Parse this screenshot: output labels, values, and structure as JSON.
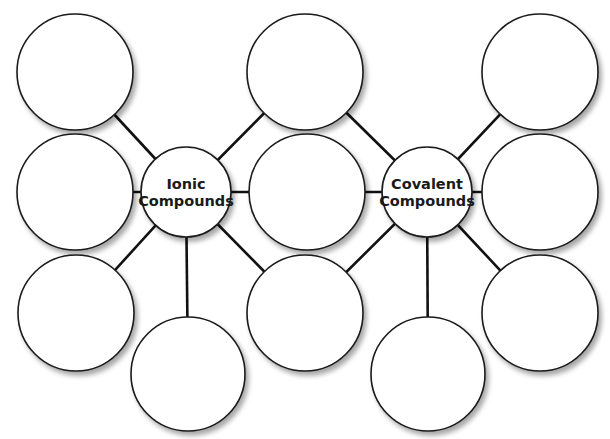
{
  "diagram": {
    "type": "double-bubble-map",
    "colors": {
      "stroke": "#1a1a1a",
      "fill": "#ffffff",
      "background": "#ffffff"
    },
    "hubs": [
      {
        "id": "ionic",
        "label_lines": [
          "Ionic",
          "Compounds"
        ]
      },
      {
        "id": "covalent",
        "label_lines": [
          "Covalent",
          "Compounds"
        ]
      }
    ],
    "bubbles": [
      {
        "id": "ionic-top-left",
        "text": "",
        "connects": [
          "ionic"
        ]
      },
      {
        "id": "ionic-mid-left",
        "text": "",
        "connects": [
          "ionic"
        ]
      },
      {
        "id": "ionic-bottom-left",
        "text": "",
        "connects": [
          "ionic"
        ]
      },
      {
        "id": "ionic-bottom",
        "text": "",
        "connects": [
          "ionic"
        ]
      },
      {
        "id": "shared-top",
        "text": "",
        "connects": [
          "ionic",
          "covalent"
        ]
      },
      {
        "id": "shared-mid",
        "text": "",
        "connects": [
          "ionic",
          "covalent"
        ]
      },
      {
        "id": "shared-bottom",
        "text": "",
        "connects": [
          "ionic",
          "covalent"
        ]
      },
      {
        "id": "covalent-top-right",
        "text": "",
        "connects": [
          "covalent"
        ]
      },
      {
        "id": "covalent-mid-right",
        "text": "",
        "connects": [
          "covalent"
        ]
      },
      {
        "id": "covalent-bottom-right",
        "text": "",
        "connects": [
          "covalent"
        ]
      },
      {
        "id": "covalent-bottom",
        "text": "",
        "connects": [
          "covalent"
        ]
      }
    ]
  }
}
